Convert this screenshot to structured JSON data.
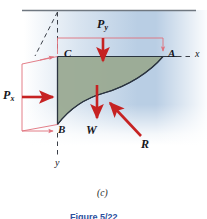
{
  "figure": {
    "caption": "(c)",
    "figure_label": "Figure 5/22",
    "subfigure_id": "c"
  },
  "colors": {
    "water": "#b9cee4",
    "body": "#9aaa92",
    "force_arrow": "#c62222",
    "pressure_outline": "#e0707c",
    "surface_line": "#6f7780",
    "outline": "#2b3440",
    "label_text": "#15161c",
    "figure_caption": "#2b4f9e"
  },
  "points": [
    {
      "id": "C",
      "label": "C",
      "x": 64,
      "y": 54
    },
    {
      "id": "A",
      "label": "A",
      "x": 168,
      "y": 54
    },
    {
      "id": "B",
      "label": "B",
      "x": 58,
      "y": 129
    }
  ],
  "axes": [
    {
      "id": "x-axis",
      "label": "x",
      "x": 195,
      "y": 53,
      "direction": "horizontal-right",
      "style": "dashed"
    },
    {
      "id": "y-axis",
      "label": "y",
      "x": 55,
      "y": 163,
      "direction": "vertical-down",
      "style": "dashed"
    }
  ],
  "forces": [
    {
      "id": "Py",
      "symbol": "P",
      "subscript": "y",
      "label_x": 97,
      "label_y": 20,
      "direction": "down",
      "description": "vertical pressure force on top surface CA"
    },
    {
      "id": "Px",
      "symbol": "P",
      "subscript": "x",
      "label_x": 3,
      "label_y": 90,
      "direction": "right",
      "description": "horizontal pressure force on left surface CB"
    },
    {
      "id": "W",
      "symbol": "W",
      "subscript": "",
      "label_x": 86,
      "label_y": 128,
      "direction": "down",
      "description": "weight of fluid element"
    },
    {
      "id": "R",
      "symbol": "R",
      "subscript": "",
      "label_x": 141,
      "label_y": 142,
      "direction": "up-left",
      "description": "resultant reaction force from curved surface"
    }
  ],
  "surface": {
    "name": "free-surface-line",
    "y": 10
  }
}
